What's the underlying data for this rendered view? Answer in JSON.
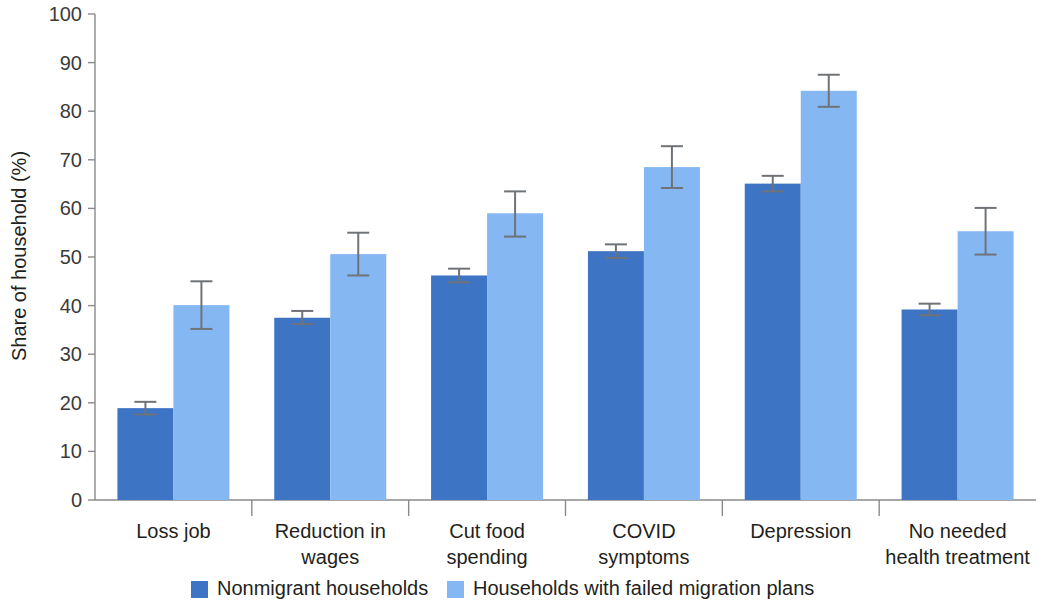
{
  "chart_data": {
    "type": "bar",
    "title": "",
    "subtitle": "",
    "xlabel": "",
    "ylabel": "Share of household (%)",
    "ylim": [
      0,
      100
    ],
    "yticks": [
      0,
      10,
      20,
      30,
      40,
      50,
      60,
      70,
      80,
      90,
      100
    ],
    "grid": false,
    "legend_position": "bottom",
    "error_bars": "present",
    "categories": [
      "Loss job",
      "Reduction in wages",
      "Cut food spending",
      "COVID symptoms",
      "Depression",
      "No needed health treatment"
    ],
    "category_lines": [
      [
        "Loss job"
      ],
      [
        "Reduction in",
        "wages"
      ],
      [
        "Cut food",
        "spending"
      ],
      [
        "COVID",
        "symptoms"
      ],
      [
        "Depression"
      ],
      [
        "No needed",
        "health treatment"
      ]
    ],
    "series": [
      {
        "name": "Nonmigrant households",
        "color": "#3d74c4",
        "values": [
          18.9,
          37.5,
          46.2,
          51.2,
          65.1,
          39.2
        ],
        "err_low": [
          17.6,
          36.2,
          44.8,
          49.8,
          63.5,
          38.0
        ],
        "err_high": [
          20.2,
          38.9,
          47.6,
          52.6,
          66.7,
          40.4
        ]
      },
      {
        "name": "Households with failed migration plans",
        "color": "#85b8f2",
        "values": [
          40.1,
          50.6,
          59.0,
          68.5,
          84.2,
          55.3
        ],
        "err_low": [
          35.2,
          46.2,
          54.2,
          64.2,
          80.9,
          50.5
        ],
        "err_high": [
          45.0,
          55.0,
          63.5,
          72.8,
          87.5,
          60.1
        ]
      }
    ]
  },
  "legend": {
    "items": [
      {
        "label": "Nonmigrant households",
        "color": "#3d74c4"
      },
      {
        "label": "Households with failed migration plans",
        "color": "#85b8f2"
      }
    ]
  },
  "axis": {
    "y_title": "Share of household (%)",
    "y_tick_labels": [
      "0",
      "10",
      "20",
      "30",
      "40",
      "50",
      "60",
      "70",
      "80",
      "90",
      "100"
    ]
  }
}
